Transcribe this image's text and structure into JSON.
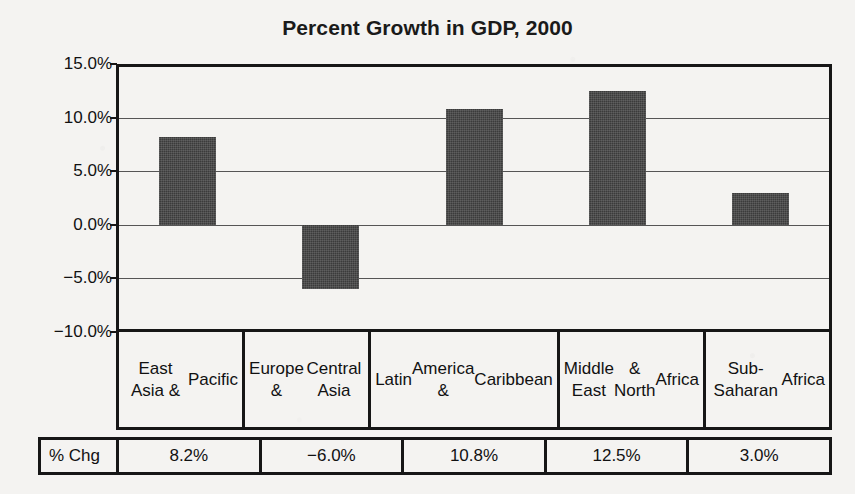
{
  "chart_data": {
    "type": "bar",
    "title": "Percent Growth in GDP, 2000",
    "xlabel": "",
    "ylabel": "",
    "ylim": [
      -10,
      15
    ],
    "grid": true,
    "legend": "none",
    "orientation": "vertical",
    "bar_color": "#3b3b3b",
    "categories": [
      "East Asia & Pacific",
      "Europe & Central Asia",
      "Latin America & Caribbean",
      "Middle East & North Africa",
      "Sub-Saharan Africa"
    ],
    "values": [
      8.2,
      -6.0,
      10.8,
      12.5,
      3.0
    ],
    "value_labels": [
      "8.2%",
      "−6.0%",
      "10.8%",
      "12.5%",
      "3.0%"
    ],
    "yticks": [
      15,
      10,
      5,
      0,
      -5,
      -10
    ],
    "ytick_labels": [
      "15.0%",
      "10.0%",
      "5.0%",
      "0.0%",
      "−5.0%",
      "−10.0%"
    ]
  },
  "table": {
    "row_label": "% Chg",
    "category_lines": [
      [
        "East Asia &",
        "Pacific"
      ],
      [
        "Europe &",
        "Central Asia"
      ],
      [
        "Latin",
        "America &",
        "Caribbean"
      ],
      [
        "Middle East",
        "& North",
        "Africa"
      ],
      [
        "Sub-Saharan",
        "Africa"
      ]
    ]
  },
  "colors": {
    "bar": "#3b3b3b",
    "frame": "#161616",
    "gridline": "#555555",
    "background": "#f4f3f1",
    "text": "#111111"
  }
}
